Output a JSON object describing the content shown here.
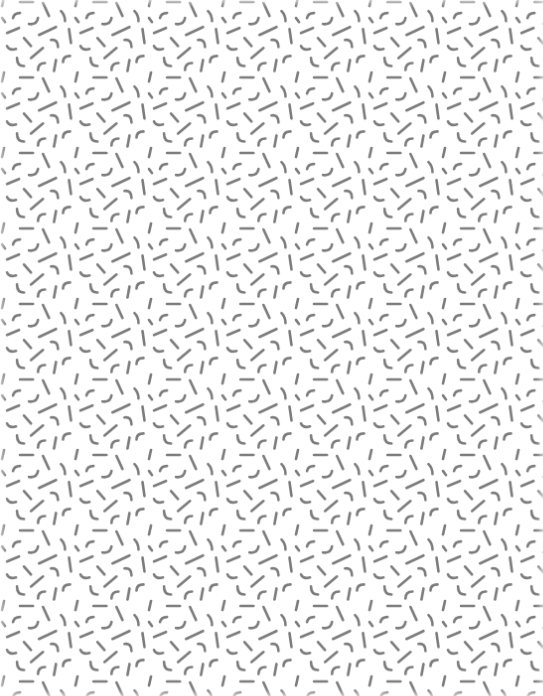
{
  "pattern": {
    "type": "memphis-squiggle-tile",
    "background_color": "#ffffff",
    "stroke_color": "#7c7c7c",
    "stroke_width": 2.6,
    "tile_width": 73.5,
    "tile_height": 75.5,
    "offset_x": -1,
    "offset_y": -4,
    "shapes": [
      {
        "kind": "line",
        "x1": 21,
        "y1": 6,
        "x2": 34,
        "y2": 6
      },
      {
        "kind": "line",
        "x1": 5,
        "y1": 1,
        "x2": 3,
        "y2": 10
      },
      {
        "kind": "line",
        "x1": 44,
        "y1": 7,
        "x2": 50,
        "y2": 20
      },
      {
        "kind": "path",
        "d": "M14 22 Q15 17 21 17"
      },
      {
        "kind": "path",
        "d": "M62 15 Q66 19 66 25"
      },
      {
        "kind": "path",
        "d": "M30 28 Q38 29 39 22"
      },
      {
        "kind": "line",
        "x1": 3,
        "y1": 22,
        "x2": 6,
        "y2": 26
      },
      {
        "kind": "line",
        "x1": 8,
        "y1": 37,
        "x2": 20,
        "y2": 32
      },
      {
        "kind": "line",
        "x1": 40,
        "y1": 39,
        "x2": 57,
        "y2": 31
      },
      {
        "kind": "line",
        "x1": 70,
        "y1": 33,
        "x2": 72,
        "y2": 47
      },
      {
        "kind": "line",
        "x1": 25,
        "y1": 42,
        "x2": 32,
        "y2": 50
      },
      {
        "kind": "path",
        "d": "M52 44 Q59 43 59 51"
      },
      {
        "kind": "path",
        "d": "M8 50 Q10 55 17 53"
      },
      {
        "kind": "line",
        "x1": 32,
        "y1": 62,
        "x2": 44,
        "y2": 52
      },
      {
        "kind": "path",
        "d": "M64 66 Q64 60 71 60"
      },
      {
        "kind": "path",
        "d": "M18 62 Q18 70 25 70"
      },
      {
        "kind": "path",
        "d": "M39 74 Q39 67 46 67"
      },
      {
        "kind": "line",
        "x1": 57,
        "y1": 64,
        "x2": 55,
        "y2": 75
      }
    ]
  }
}
